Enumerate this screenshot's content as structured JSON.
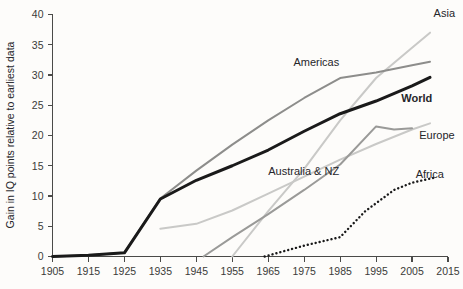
{
  "chart_data": {
    "type": "line",
    "title": "",
    "xlabel": "",
    "ylabel": "Gain in IQ points relative to earliest data",
    "xlim": [
      1905,
      2015
    ],
    "ylim": [
      0,
      40
    ],
    "xticks": [
      1905,
      1915,
      1925,
      1935,
      1945,
      1955,
      1965,
      1975,
      1985,
      1995,
      2005,
      2015
    ],
    "yticks": [
      0,
      5,
      10,
      15,
      20,
      25,
      30,
      35,
      40
    ],
    "grid": false,
    "legend_position": "inline-right",
    "series": [
      {
        "name": "Asia",
        "color": "#c9c9c7",
        "style": "solid",
        "width": 2.0,
        "label_x": 2011,
        "label_y": 39.6,
        "points": [
          {
            "x": 1955,
            "y": 0
          },
          {
            "x": 1965,
            "y": 7.5
          },
          {
            "x": 1975,
            "y": 14.5
          },
          {
            "x": 1985,
            "y": 22.5
          },
          {
            "x": 1995,
            "y": 29.5
          },
          {
            "x": 2005,
            "y": 34.5
          },
          {
            "x": 2010,
            "y": 37.0
          }
        ]
      },
      {
        "name": "Americas",
        "color": "#8d8d8b",
        "style": "solid",
        "width": 2.0,
        "label_x": 1972,
        "label_y": 31.5,
        "points": [
          {
            "x": 1905,
            "y": 0
          },
          {
            "x": 1915,
            "y": 0.2
          },
          {
            "x": 1925,
            "y": 0.6
          },
          {
            "x": 1935,
            "y": 9.6
          },
          {
            "x": 1945,
            "y": 14.2
          },
          {
            "x": 1955,
            "y": 18.5
          },
          {
            "x": 1965,
            "y": 22.5
          },
          {
            "x": 1975,
            "y": 26.2
          },
          {
            "x": 1985,
            "y": 29.5
          },
          {
            "x": 1995,
            "y": 30.4
          },
          {
            "x": 2005,
            "y": 31.6
          },
          {
            "x": 2010,
            "y": 32.2
          }
        ]
      },
      {
        "name": "World",
        "color": "#1a1a1a",
        "style": "solid",
        "width": 3.0,
        "label_x": 2002,
        "label_y": 25.5,
        "points": [
          {
            "x": 1905,
            "y": 0
          },
          {
            "x": 1915,
            "y": 0.2
          },
          {
            "x": 1925,
            "y": 0.6
          },
          {
            "x": 1935,
            "y": 9.5
          },
          {
            "x": 1945,
            "y": 12.6
          },
          {
            "x": 1955,
            "y": 15.0
          },
          {
            "x": 1965,
            "y": 17.6
          },
          {
            "x": 1975,
            "y": 20.7
          },
          {
            "x": 1985,
            "y": 23.6
          },
          {
            "x": 1995,
            "y": 25.7
          },
          {
            "x": 2005,
            "y": 28.2
          },
          {
            "x": 2010,
            "y": 29.6
          }
        ]
      },
      {
        "name": "Europe",
        "color": "#c9c9c7",
        "style": "solid",
        "width": 2.0,
        "label_x": 2007,
        "label_y": 19.5,
        "points": [
          {
            "x": 1935,
            "y": 4.6
          },
          {
            "x": 1945,
            "y": 5.4
          },
          {
            "x": 1955,
            "y": 7.6
          },
          {
            "x": 1965,
            "y": 10.4
          },
          {
            "x": 1975,
            "y": 13.2
          },
          {
            "x": 1985,
            "y": 16.0
          },
          {
            "x": 1995,
            "y": 18.6
          },
          {
            "x": 2005,
            "y": 21.0
          },
          {
            "x": 2010,
            "y": 22.0
          }
        ]
      },
      {
        "name": "Australia & NZ",
        "color": "#9a9a98",
        "style": "solid",
        "width": 2.0,
        "label_x": 1965,
        "label_y": 13.5,
        "points": [
          {
            "x": 1947,
            "y": 0
          },
          {
            "x": 1955,
            "y": 3.2
          },
          {
            "x": 1965,
            "y": 7.0
          },
          {
            "x": 1975,
            "y": 11.0
          },
          {
            "x": 1985,
            "y": 15.2
          },
          {
            "x": 1995,
            "y": 21.5
          },
          {
            "x": 2000,
            "y": 21.0
          },
          {
            "x": 2005,
            "y": 21.2
          }
        ]
      },
      {
        "name": "Africa",
        "color": "#1a1a1a",
        "style": "dotted",
        "width": 2.4,
        "label_x": 2006,
        "label_y": 13.0,
        "points": [
          {
            "x": 1964,
            "y": 0
          },
          {
            "x": 1975,
            "y": 1.8
          },
          {
            "x": 1985,
            "y": 3.2
          },
          {
            "x": 1992,
            "y": 7.5
          },
          {
            "x": 2000,
            "y": 11.0
          },
          {
            "x": 2005,
            "y": 12.2
          },
          {
            "x": 2011,
            "y": 13.0
          }
        ]
      }
    ]
  }
}
